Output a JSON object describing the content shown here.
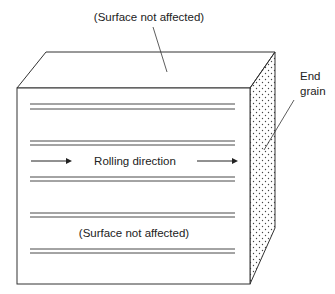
{
  "diagram": {
    "labels": {
      "top_surface": "(Surface not affected)",
      "front_surface": "(Surface not affected)",
      "end_grain_line1": "End",
      "end_grain_line2": "grain",
      "rolling_direction": "Rolling direction"
    },
    "colors": {
      "stroke": "#333333",
      "dots": "#444444",
      "background": "#ffffff"
    },
    "grain_line_pairs_y": [
      104,
      141,
      177,
      213,
      249
    ]
  }
}
